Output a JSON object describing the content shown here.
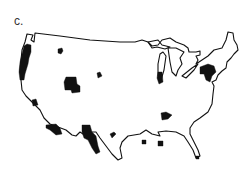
{
  "figure": {
    "panel_label": "c.",
    "map_subject": "Continental United States outline",
    "colors": {
      "background": "#ffffff",
      "outline": "#111111",
      "highlighted_regions": "#111111"
    },
    "highlighted_regions": [
      {
        "name": "pacific-coast-strip",
        "approx_location": "Western Washington / Oregon / Northern California coast"
      },
      {
        "name": "idaho-montana-spot",
        "approx_location": "Northern Rockies"
      },
      {
        "name": "utah-colorado-block",
        "approx_location": "Utah / Colorado"
      },
      {
        "name": "wyoming-spot",
        "approx_location": "Central Rockies"
      },
      {
        "name": "nevada-california-spot",
        "approx_location": "Southern Nevada"
      },
      {
        "name": "southern-california-arizona-border",
        "approx_location": "Southern California / Arizona"
      },
      {
        "name": "west-texas-new-mexico-block",
        "approx_location": "New Mexico / West Texas"
      },
      {
        "name": "texas-panhandle-spot",
        "approx_location": "North Texas"
      },
      {
        "name": "lake-michigan-spot",
        "approx_location": "Western Michigan / Indiana"
      },
      {
        "name": "new-york-pennsylvania-block",
        "approx_location": "New York / Pennsylvania / New Jersey"
      },
      {
        "name": "tennessee-spot",
        "approx_location": "Tennessee / Kentucky"
      },
      {
        "name": "mississippi-spot",
        "approx_location": "Mississippi / Alabama"
      },
      {
        "name": "gulf-coast-spot",
        "approx_location": "Alabama / Florida panhandle"
      }
    ]
  }
}
